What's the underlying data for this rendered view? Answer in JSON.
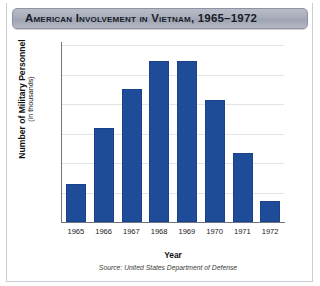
{
  "chart_data": {
    "type": "bar",
    "title": "American Involvement in Vietnam, 1965–1972",
    "xlabel": "Year",
    "ylabel": "Number of Military Personnel",
    "ylabel_sub": "(in thousands)",
    "categories": [
      "1965",
      "1966",
      "1967",
      "1968",
      "1969",
      "1970",
      "1971",
      "1972"
    ],
    "values": [
      130,
      320,
      450,
      545,
      545,
      413,
      235,
      70
    ],
    "ylim": [
      0,
      600
    ],
    "yticks": [
      0,
      100,
      200,
      300,
      400,
      500,
      600
    ],
    "ytick_labels": [
      "0",
      "100",
      "200",
      "300",
      "400",
      "500",
      "600"
    ],
    "grid": true,
    "legend": "none",
    "bar_color": "#1f4c99",
    "source": "Source: United States Department of Defense"
  }
}
